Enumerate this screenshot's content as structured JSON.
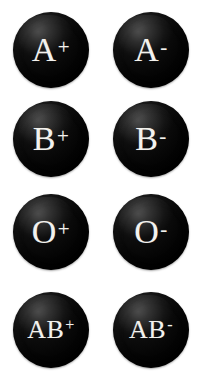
{
  "page": {
    "background_color": "#ffffff",
    "badge_color": "#000000",
    "label_color": "#f3f2ee",
    "columns": 2,
    "rows": 4
  },
  "badges": [
    {
      "id": "a-positive",
      "group": "A",
      "rh": "+",
      "label": "A+",
      "row": 1,
      "column": "left"
    },
    {
      "id": "a-negative",
      "group": "A",
      "rh": "-",
      "label": "A-",
      "row": 1,
      "column": "right"
    },
    {
      "id": "b-positive",
      "group": "B",
      "rh": "+",
      "label": "B+",
      "row": 2,
      "column": "left"
    },
    {
      "id": "b-negative",
      "group": "B",
      "rh": "-",
      "label": "B-",
      "row": 2,
      "column": "right"
    },
    {
      "id": "o-positive",
      "group": "O",
      "rh": "+",
      "label": "O+",
      "row": 3,
      "column": "left"
    },
    {
      "id": "o-negative",
      "group": "O",
      "rh": "-",
      "label": "O-",
      "row": 3,
      "column": "right"
    },
    {
      "id": "ab-positive",
      "group": "AB",
      "rh": "+",
      "label": "AB+",
      "row": 4,
      "column": "left"
    },
    {
      "id": "ab-negative",
      "group": "AB",
      "rh": "-",
      "label": "AB-",
      "row": 4,
      "column": "right"
    }
  ]
}
